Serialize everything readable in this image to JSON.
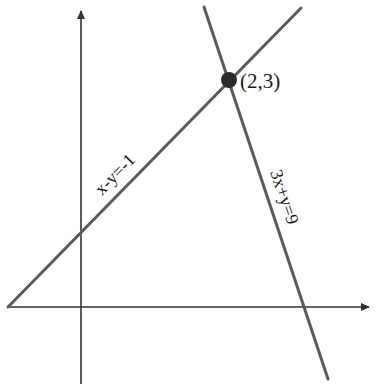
{
  "diagram": {
    "type": "coordinate-plane-linear-system",
    "axes": {
      "x_axis": {
        "has_arrow": true
      },
      "y_axis": {
        "has_arrow": true
      }
    },
    "lines": [
      {
        "id": "line1",
        "equation": "x-y=-1",
        "label": "x-y=-1"
      },
      {
        "id": "line2",
        "equation": "3x+y=9",
        "label": "3x+y=9"
      }
    ],
    "intersection": {
      "label": "(2,3)",
      "x": 2,
      "y": 3
    },
    "colors": {
      "axis": "#333333",
      "line": "#5a5a5a",
      "point": "#2a2a2a",
      "text": "#1a1a1a"
    }
  }
}
